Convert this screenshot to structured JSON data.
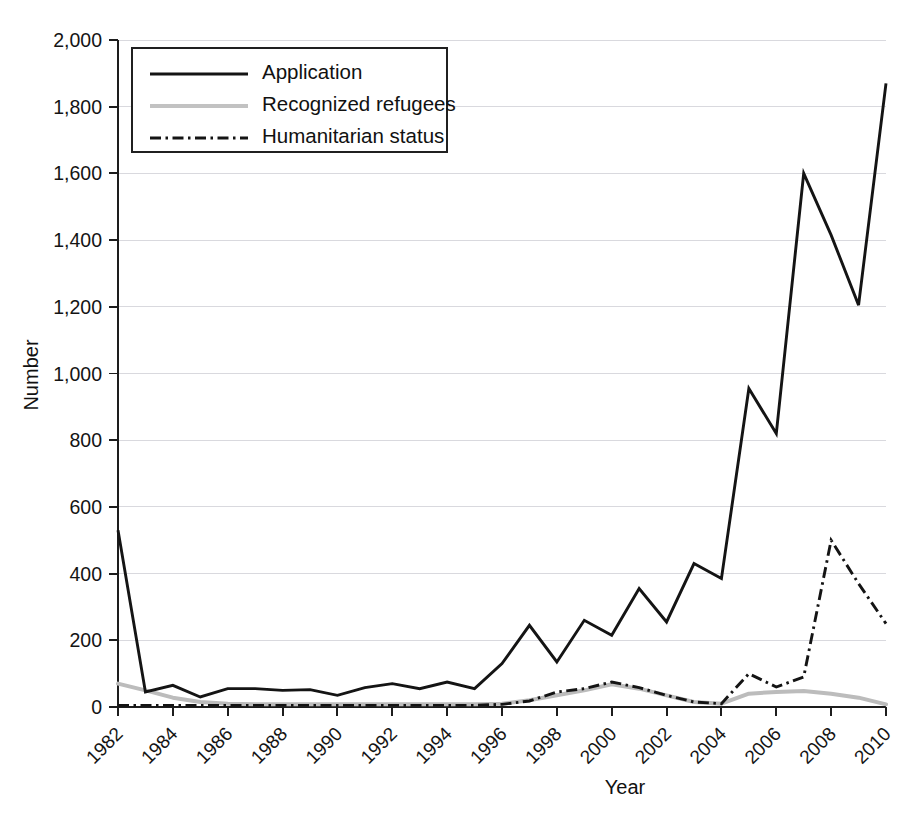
{
  "chart_data": {
    "type": "line",
    "title": "",
    "xlabel": "Year",
    "ylabel": "Number",
    "xlim": [
      1982,
      2010
    ],
    "ylim": [
      0,
      2000
    ],
    "grid": true,
    "legend_position": "top-left",
    "x": [
      1982,
      1983,
      1984,
      1985,
      1986,
      1987,
      1988,
      1989,
      1990,
      1991,
      1992,
      1993,
      1994,
      1995,
      1996,
      1997,
      1998,
      1999,
      2000,
      2001,
      2002,
      2003,
      2004,
      2005,
      2006,
      2007,
      2008,
      2009,
      2010
    ],
    "xticks": [
      1982,
      1984,
      1986,
      1988,
      1990,
      1992,
      1994,
      1996,
      1998,
      2000,
      2002,
      2004,
      2006,
      2008,
      2010
    ],
    "xtick_labels": [
      "1982",
      "1984",
      "1986",
      "1988",
      "1990",
      "1992",
      "1994",
      "1996",
      "1998",
      "2000",
      "2002",
      "2004",
      "2006",
      "2008",
      "2010"
    ],
    "yticks": [
      0,
      200,
      400,
      600,
      800,
      1000,
      1200,
      1400,
      1600,
      1800,
      2000
    ],
    "ytick_labels": [
      "0",
      "200",
      "400",
      "600",
      "800",
      "1,000",
      "1,200",
      "1,400",
      "1,600",
      "1,800",
      "2,000"
    ],
    "series": [
      {
        "name": "Application",
        "style": "solid",
        "color": "#141414",
        "values": [
          530,
          45,
          65,
          30,
          55,
          55,
          50,
          52,
          35,
          58,
          70,
          55,
          75,
          55,
          130,
          245,
          135,
          260,
          215,
          355,
          255,
          430,
          385,
          955,
          820,
          1600,
          1415,
          1205,
          1870
        ]
      },
      {
        "name": "Recognized refugees",
        "style": "solid",
        "color": "#bcbcbc",
        "values": [
          70,
          50,
          28,
          15,
          10,
          8,
          8,
          8,
          8,
          8,
          8,
          8,
          8,
          8,
          10,
          20,
          35,
          50,
          68,
          55,
          35,
          15,
          10,
          40,
          45,
          48,
          40,
          28,
          8
        ]
      },
      {
        "name": "Humanitarian status",
        "style": "dash-dot",
        "color": "#141414",
        "values": [
          5,
          5,
          5,
          5,
          5,
          5,
          5,
          5,
          5,
          5,
          5,
          5,
          5,
          5,
          8,
          18,
          45,
          55,
          75,
          58,
          35,
          15,
          10,
          100,
          60,
          90,
          500,
          370,
          250
        ]
      }
    ],
    "legend": [
      {
        "label": "Application",
        "style": "solid",
        "color": "#141414"
      },
      {
        "label": "Recognized refugees",
        "style": "solid",
        "color": "#bcbcbc"
      },
      {
        "label": "Humanitarian status",
        "style": "dash-dot",
        "color": "#141414"
      }
    ]
  }
}
